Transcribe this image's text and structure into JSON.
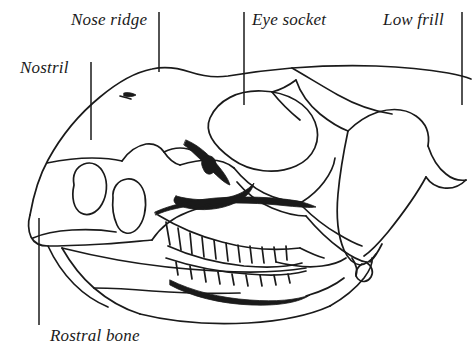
{
  "figure": {
    "name": "ceratopsian-skull-lateral-view",
    "background_color": "#ffffff",
    "ink_color": "#1a1a1a",
    "width": 473,
    "height": 354
  },
  "labels": {
    "nose_ridge": "Nose ridge",
    "eye_socket": "Eye socket",
    "low_frill": "Low frill",
    "nostril": "Nostril",
    "rostral_bone": "Rostral bone"
  },
  "leader_lines": [
    {
      "name": "nose-ridge-leader",
      "x1": 159,
      "y1": 12,
      "x2": 159,
      "y2": 72
    },
    {
      "name": "eye-socket-leader",
      "x1": 244,
      "y1": 12,
      "x2": 244,
      "y2": 105
    },
    {
      "name": "low-frill-leader",
      "x1": 462,
      "y1": 12,
      "x2": 462,
      "y2": 105
    },
    {
      "name": "nostril-leader",
      "x1": 91,
      "y1": 62,
      "x2": 91,
      "y2": 140
    },
    {
      "name": "rostral-bone-leader",
      "x1": 39,
      "y1": 218,
      "x2": 39,
      "y2": 325
    }
  ]
}
